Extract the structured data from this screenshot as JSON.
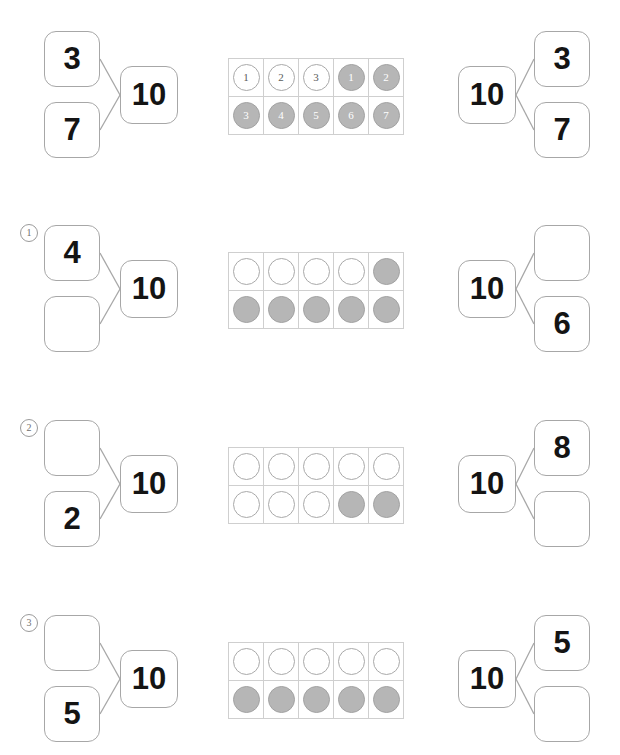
{
  "worksheet": {
    "title": "Make 10 number bonds with ten frames",
    "whole_value": "10",
    "empty_value": ""
  },
  "colors": {
    "counter_filled": "#b6b6b6",
    "counter_empty": "#ffffff",
    "box_border": "#a7a7a7",
    "grid_line": "#cfcfcf",
    "number_text": "#141414",
    "index_text": "#6f6f6f"
  },
  "rows": [
    {
      "index_label": "",
      "has_index": false,
      "left_bond": {
        "part_a": "3",
        "part_b": "7",
        "whole": "10"
      },
      "ten_frame": {
        "numbered": true,
        "cells": [
          {
            "state": "white",
            "label": "1"
          },
          {
            "state": "white",
            "label": "2"
          },
          {
            "state": "white",
            "label": "3"
          },
          {
            "state": "gray",
            "label": "1"
          },
          {
            "state": "gray",
            "label": "2"
          },
          {
            "state": "gray",
            "label": "3"
          },
          {
            "state": "gray",
            "label": "4"
          },
          {
            "state": "gray",
            "label": "5"
          },
          {
            "state": "gray",
            "label": "6"
          },
          {
            "state": "gray",
            "label": "7"
          }
        ],
        "white_count": "3",
        "gray_count": "7"
      },
      "right_bond": {
        "whole": "10",
        "part_a": "3",
        "part_b": "7"
      }
    },
    {
      "index_label": "1",
      "has_index": true,
      "left_bond": {
        "part_a": "4",
        "part_b": "",
        "whole": "10"
      },
      "ten_frame": {
        "numbered": false,
        "cells": [
          {
            "state": "white",
            "label": ""
          },
          {
            "state": "white",
            "label": ""
          },
          {
            "state": "white",
            "label": ""
          },
          {
            "state": "white",
            "label": ""
          },
          {
            "state": "gray",
            "label": ""
          },
          {
            "state": "gray",
            "label": ""
          },
          {
            "state": "gray",
            "label": ""
          },
          {
            "state": "gray",
            "label": ""
          },
          {
            "state": "gray",
            "label": ""
          },
          {
            "state": "gray",
            "label": ""
          }
        ],
        "white_count": "4",
        "gray_count": "6"
      },
      "right_bond": {
        "whole": "10",
        "part_a": "",
        "part_b": "6"
      }
    },
    {
      "index_label": "2",
      "has_index": true,
      "left_bond": {
        "part_a": "",
        "part_b": "2",
        "whole": "10"
      },
      "ten_frame": {
        "numbered": false,
        "cells": [
          {
            "state": "white",
            "label": ""
          },
          {
            "state": "white",
            "label": ""
          },
          {
            "state": "white",
            "label": ""
          },
          {
            "state": "white",
            "label": ""
          },
          {
            "state": "white",
            "label": ""
          },
          {
            "state": "white",
            "label": ""
          },
          {
            "state": "white",
            "label": ""
          },
          {
            "state": "white",
            "label": ""
          },
          {
            "state": "gray",
            "label": ""
          },
          {
            "state": "gray",
            "label": ""
          }
        ],
        "white_count": "8",
        "gray_count": "2"
      },
      "right_bond": {
        "whole": "10",
        "part_a": "8",
        "part_b": ""
      }
    },
    {
      "index_label": "3",
      "has_index": true,
      "left_bond": {
        "part_a": "",
        "part_b": "5",
        "whole": "10"
      },
      "ten_frame": {
        "numbered": false,
        "cells": [
          {
            "state": "white",
            "label": ""
          },
          {
            "state": "white",
            "label": ""
          },
          {
            "state": "white",
            "label": ""
          },
          {
            "state": "white",
            "label": ""
          },
          {
            "state": "white",
            "label": ""
          },
          {
            "state": "gray",
            "label": ""
          },
          {
            "state": "gray",
            "label": ""
          },
          {
            "state": "gray",
            "label": ""
          },
          {
            "state": "gray",
            "label": ""
          },
          {
            "state": "gray",
            "label": ""
          }
        ],
        "white_count": "5",
        "gray_count": "5"
      },
      "right_bond": {
        "whole": "10",
        "part_a": "5",
        "part_b": ""
      }
    }
  ]
}
